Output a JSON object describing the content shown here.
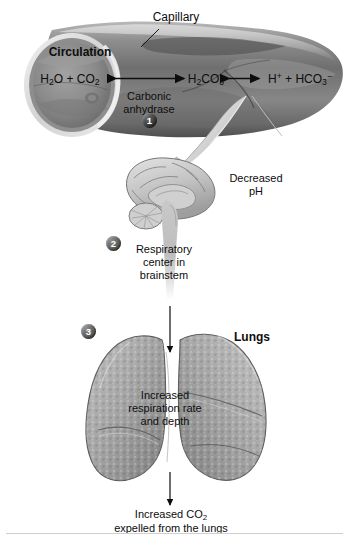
{
  "diagram": {
    "background_color": "#ffffff",
    "ink_color": "#0d0d0d"
  },
  "capillary": {
    "label": "Capillary",
    "circulation_label": "Circulation",
    "equation": {
      "left_html": "H<sub>2</sub>O + CO<sub>2</sub>",
      "middle_html": "H<sub>2</sub>CO<sub>3</sub>",
      "right_html": "H<sup>+</sup> + HCO<sub>3</sub><sup>−</sup>",
      "left_plain": "H2O + CO2",
      "middle_plain": "H2CO3",
      "right_plain": "H+ + HCO3-"
    },
    "enzyme_line1": "Carbonic",
    "enzyme_line2": "anhydrase"
  },
  "steps": [
    {
      "number": "1",
      "tone": "dark"
    },
    {
      "number": "2",
      "tone": "mid"
    },
    {
      "number": "3",
      "tone": "mid"
    }
  ],
  "brain": {
    "decreased_ph_line1": "Decreased",
    "decreased_ph_line2": "pH",
    "center_line1": "Respiratory",
    "center_line2": "center in",
    "center_line3": "brainstem"
  },
  "lungs": {
    "label": "Lungs",
    "effect_line1": "Increased",
    "effect_line2": "respiration rate",
    "effect_line3": "and depth"
  },
  "outcome": {
    "line1_html": "Increased CO<sub>2</sub>",
    "line1_plain": "Increased CO2",
    "line2": "expelled from the lungs"
  }
}
